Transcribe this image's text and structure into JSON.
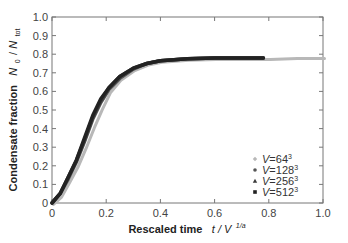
{
  "chart_data": {
    "type": "scatter",
    "title": "",
    "xlabel": "Rescaled time",
    "xlabel_math": "t / V^{1/a}",
    "ylabel": "Condensate fraction",
    "ylabel_math": "N_0 / N_tot",
    "xlim": [
      0,
      1.0
    ],
    "ylim": [
      0,
      1.0
    ],
    "x_ticks": [
      "0",
      "0.2",
      "0.4",
      "0.6",
      "0.8",
      "1.0"
    ],
    "y_ticks": [
      "0",
      "0.1",
      "0.2",
      "0.3",
      "0.4",
      "0.5",
      "0.6",
      "0.7",
      "0.8",
      "0.9",
      "1.0"
    ],
    "grid": false,
    "legend_position": "lower right",
    "series": [
      {
        "name": "V=64^3",
        "label": "V=64",
        "exp": "3",
        "marker": "diamond",
        "color": "#b8b8b8",
        "x": [
          0.0,
          0.03,
          0.06,
          0.09,
          0.12,
          0.15,
          0.18,
          0.21,
          0.25,
          0.3,
          0.35,
          0.4,
          0.5,
          0.6,
          0.7,
          0.8,
          0.9,
          1.0
        ],
        "y": [
          0.0,
          0.04,
          0.12,
          0.2,
          0.3,
          0.41,
          0.51,
          0.6,
          0.67,
          0.72,
          0.75,
          0.765,
          0.775,
          0.78,
          0.78,
          0.78,
          0.785,
          0.785
        ]
      },
      {
        "name": "V=128^3",
        "label": "V=128",
        "exp": "3",
        "marker": "circle",
        "color": "#555555",
        "x": [
          0.0,
          0.03,
          0.06,
          0.09,
          0.12,
          0.15,
          0.18,
          0.21,
          0.25,
          0.3,
          0.35,
          0.4,
          0.5,
          0.6,
          0.7,
          0.78
        ],
        "y": [
          0.0,
          0.05,
          0.13,
          0.22,
          0.33,
          0.45,
          0.54,
          0.61,
          0.67,
          0.72,
          0.75,
          0.765,
          0.775,
          0.78,
          0.78,
          0.78
        ]
      },
      {
        "name": "V=256^3",
        "label": "V=256",
        "exp": "3",
        "marker": "triangle",
        "color": "#3a3a3a",
        "x": [
          0.0,
          0.03,
          0.06,
          0.09,
          0.12,
          0.15,
          0.18,
          0.21,
          0.25,
          0.3,
          0.35,
          0.4,
          0.5,
          0.6,
          0.7,
          0.78
        ],
        "y": [
          0.0,
          0.05,
          0.14,
          0.23,
          0.34,
          0.46,
          0.55,
          0.62,
          0.68,
          0.725,
          0.75,
          0.765,
          0.775,
          0.78,
          0.78,
          0.78
        ]
      },
      {
        "name": "V=512^3",
        "label": "V=512",
        "exp": "3",
        "marker": "square",
        "color": "#222222",
        "x": [
          0.0,
          0.03,
          0.06,
          0.09,
          0.12,
          0.15,
          0.18,
          0.21,
          0.25,
          0.3,
          0.35,
          0.4,
          0.5,
          0.6,
          0.7,
          0.78
        ],
        "y": [
          0.0,
          0.05,
          0.14,
          0.23,
          0.35,
          0.47,
          0.56,
          0.62,
          0.68,
          0.725,
          0.75,
          0.765,
          0.775,
          0.78,
          0.78,
          0.78
        ]
      }
    ]
  },
  "axes": {
    "y_title": "Condensate fraction",
    "y_math_num": "N",
    "y_math_num_sub": "0",
    "y_math_sep": " / ",
    "y_math_den": "N",
    "y_math_den_sub": "tot",
    "x_title": "Rescaled time",
    "x_math": "t / V",
    "x_math_sup": "1/a"
  }
}
